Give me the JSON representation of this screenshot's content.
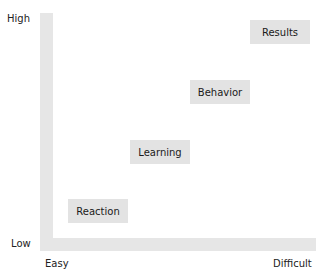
{
  "axes": {
    "y_high": "High",
    "y_low": "Low",
    "x_easy": "Easy",
    "x_difficult": "Difficult"
  },
  "levels": [
    {
      "label": "Reaction"
    },
    {
      "label": "Learning"
    },
    {
      "label": "Behavior"
    },
    {
      "label": "Results"
    }
  ],
  "colors": {
    "axis": "#e6e6e6",
    "box": "#e3e3e3",
    "text": "#1a1a1a"
  }
}
